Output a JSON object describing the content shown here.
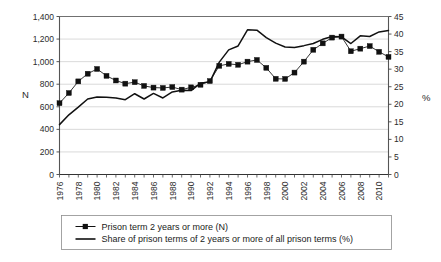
{
  "chart_data": {
    "type": "line",
    "title": "",
    "xlabel": "",
    "ylabel": "N",
    "y2label": "%",
    "grid": true,
    "legend_position": "bottom",
    "xlim": [
      1976,
      2011
    ],
    "ylim": [
      0,
      1400
    ],
    "y2lim": [
      0,
      45
    ],
    "y_ticks": [
      "0",
      "200",
      "400",
      "600",
      "800",
      "1,000",
      "1,200",
      "1,400"
    ],
    "y_tick_values": [
      0,
      200,
      400,
      600,
      800,
      1000,
      1200,
      1400
    ],
    "y2_ticks": [
      "0",
      "5",
      "10",
      "15",
      "20",
      "25",
      "30",
      "35",
      "40",
      "45"
    ],
    "y2_tick_values": [
      0,
      5,
      10,
      15,
      20,
      25,
      30,
      35,
      40,
      45
    ],
    "x": [
      1976,
      1977,
      1978,
      1979,
      1980,
      1981,
      1982,
      1983,
      1984,
      1985,
      1986,
      1987,
      1988,
      1989,
      1990,
      1991,
      1992,
      1993,
      1994,
      1995,
      1996,
      1997,
      1998,
      1999,
      2000,
      2001,
      2002,
      2003,
      2004,
      2005,
      2006,
      2007,
      2008,
      2009,
      2010,
      2011
    ],
    "x_tick_labels": [
      "1976",
      "1978",
      "1980",
      "1982",
      "1984",
      "1986",
      "1988",
      "1990",
      "1992",
      "1994",
      "1996",
      "1998",
      "2000",
      "2002",
      "2004",
      "2006",
      "2008",
      "2010"
    ],
    "x_tick_label_values": [
      1976,
      1978,
      1980,
      1982,
      1984,
      1986,
      1988,
      1990,
      1992,
      1994,
      1996,
      1998,
      2000,
      2002,
      2004,
      2006,
      2008,
      2010
    ],
    "series": [
      {
        "name": "Prison term 2 years or more (N)",
        "axis": "left",
        "marker": "square",
        "color": "#111111",
        "values": [
          632,
          722,
          825,
          893,
          935,
          874,
          833,
          805,
          818,
          785,
          770,
          767,
          775,
          752,
          772,
          795,
          828,
          963,
          980,
          972,
          1000,
          1015,
          945,
          848,
          847,
          903,
          1000,
          1105,
          1162,
          1213,
          1222,
          1092,
          1115,
          1138,
          1087,
          1042
        ]
      },
      {
        "name": "Share of prison terms of 2 years or more of all prison terms (%)",
        "axis": "right",
        "marker": "none",
        "color": "#111111",
        "values": [
          14.2,
          17.0,
          19.2,
          21.5,
          22.1,
          22.0,
          21.8,
          21.3,
          23.0,
          21.5,
          23.1,
          21.8,
          23.5,
          24.0,
          23.9,
          26.0,
          26.4,
          32.0,
          35.5,
          36.6,
          41.2,
          41.1,
          39.0,
          37.4,
          36.3,
          36.2,
          36.7,
          37.3,
          38.5,
          39.3,
          39.2,
          37.3,
          39.5,
          39.3,
          40.6,
          41.0
        ]
      }
    ]
  },
  "legend": {
    "items": [
      {
        "label": "Prison term 2 years or more (N)",
        "marker": "line-with-square-marker"
      },
      {
        "label": "Share of prison terms of 2 years or more of all prison terms (%)",
        "marker": "plain-line"
      }
    ]
  },
  "axes": {
    "left_title": "N",
    "right_title": "%"
  }
}
